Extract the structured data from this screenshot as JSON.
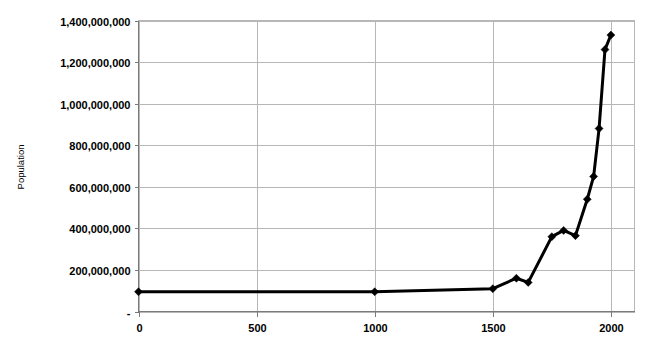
{
  "chart_data": {
    "type": "line",
    "title": "",
    "xlabel": "",
    "ylabel": "Population",
    "xlim": [
      0,
      2100
    ],
    "ylim": [
      0,
      1400000000
    ],
    "grid": true,
    "legend": false,
    "series_name": "World Population",
    "marker": "diamond",
    "line_color": "#000000",
    "grid_color": "#b7b7b7",
    "x_tick_labels": [
      "0",
      "500",
      "1000",
      "1500",
      "2000"
    ],
    "x_tick_values": [
      0,
      500,
      1000,
      1500,
      2000
    ],
    "y_tick_labels": [
      "1,400,000,000",
      "1,200,000,000",
      "1,000,000,000",
      "800,000,000",
      "600,000,000",
      "400,000,000",
      "200,000,000",
      "-"
    ],
    "y_tick_values": [
      1400000000,
      1200000000,
      1000000000,
      800000000,
      600000000,
      400000000,
      200000000,
      0
    ],
    "x": [
      0,
      1000,
      1500,
      1600,
      1650,
      1750,
      1800,
      1850,
      1900,
      1927,
      1950,
      1975,
      2000
    ],
    "values": [
      95000000,
      95000000,
      110000000,
      160000000,
      140000000,
      360000000,
      390000000,
      365000000,
      540000000,
      650000000,
      880000000,
      1260000000,
      1330000000
    ],
    "points": [
      {
        "x": 0,
        "y": 95000000
      },
      {
        "x": 1000,
        "y": 95000000
      },
      {
        "x": 1500,
        "y": 110000000
      },
      {
        "x": 1600,
        "y": 160000000
      },
      {
        "x": 1650,
        "y": 140000000
      },
      {
        "x": 1750,
        "y": 360000000
      },
      {
        "x": 1800,
        "y": 390000000
      },
      {
        "x": 1850,
        "y": 365000000
      },
      {
        "x": 1900,
        "y": 540000000
      },
      {
        "x": 1927,
        "y": 650000000
      },
      {
        "x": 1950,
        "y": 880000000
      },
      {
        "x": 1975,
        "y": 1260000000
      },
      {
        "x": 2000,
        "y": 1330000000
      }
    ]
  }
}
